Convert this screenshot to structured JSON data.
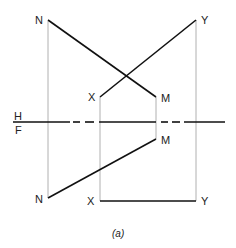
{
  "diagram": {
    "reference_line": {
      "upper_label": "H",
      "lower_label": "F"
    },
    "points_top": {
      "N": "N",
      "X": "X",
      "M": "M",
      "Y": "Y"
    },
    "points_bottom": {
      "N": "N",
      "X": "X",
      "M": "M",
      "Y": "Y"
    },
    "caption": "(a)",
    "colors": {
      "line": "#111111",
      "projector": "#b0b0b0"
    }
  }
}
